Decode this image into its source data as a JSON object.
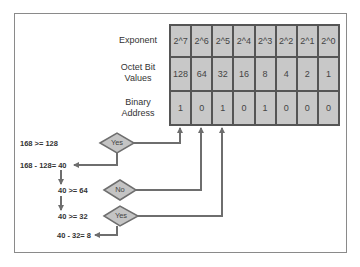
{
  "table": {
    "row_labels": [
      "Exponent",
      "Octet Bit\nValues",
      "Binary\nAddress"
    ],
    "row_label_lines": [
      [
        "Exponent"
      ],
      [
        "Octet Bit",
        "Values"
      ],
      [
        "Binary",
        "Address"
      ]
    ],
    "exponent": [
      "2^7",
      "2^6",
      "2^5",
      "2^4",
      "2^3",
      "2^2",
      "2^1",
      "2^0"
    ],
    "octet_bit_values": [
      "128",
      "64",
      "32",
      "16",
      "8",
      "4",
      "2",
      "1"
    ],
    "binary_address": [
      "1",
      "0",
      "1",
      "0",
      "1",
      "0",
      "0",
      "0"
    ]
  },
  "flow": {
    "step1_compare": "168 >= 128",
    "step1_decision": "Yes",
    "step1_result": "168 - 128= 40",
    "step2_compare": "40 >= 64",
    "step2_decision": "No",
    "step3_compare": "40 >= 32",
    "step3_decision": "Yes",
    "step3_result": "40 - 32= 8"
  },
  "colors": {
    "cell_fill": "#c8c8c8",
    "grid_line": "#555555",
    "arrow": "#6e6e6e",
    "diamond_fill": "#c4c4c4",
    "frame": "#8a8a8a"
  }
}
